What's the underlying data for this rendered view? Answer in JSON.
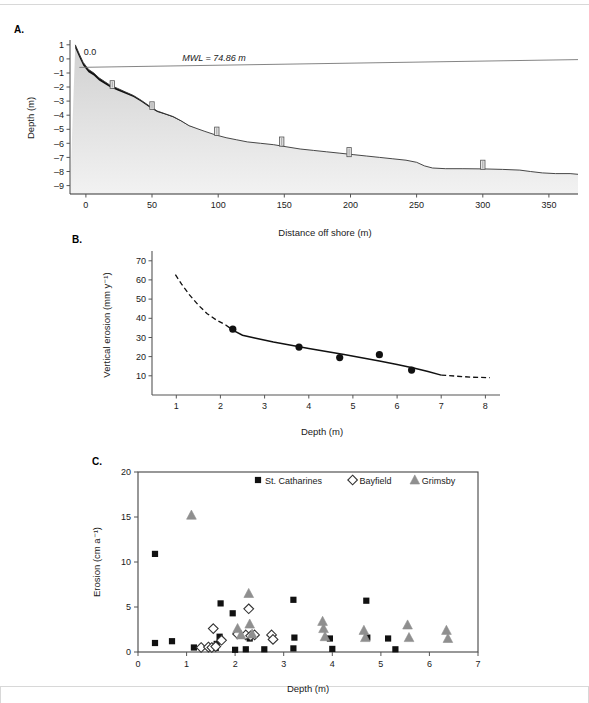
{
  "figure": {
    "panels": [
      "A.",
      "B.",
      "C."
    ]
  },
  "panel_a": {
    "letter": "A.",
    "xlabel": "Distance off shore (m)",
    "ylabel": "Depth (m)",
    "mwl_label": "MWL = 74.86 m",
    "origin_label": "0.0",
    "xticks": [
      0,
      50,
      100,
      150,
      200,
      250,
      300,
      350
    ],
    "yticks": [
      1,
      0,
      -1,
      -2,
      -3,
      -4,
      -5,
      -6,
      -7,
      -8,
      -9
    ],
    "xlim": [
      -12,
      372
    ],
    "ylim": [
      -9.6,
      1.2
    ],
    "mwl_level": -0.55,
    "profile": [
      [
        -8,
        1.0
      ],
      [
        -5,
        0.35
      ],
      [
        -2,
        -0.25
      ],
      [
        2,
        -0.75
      ],
      [
        6,
        -1.0
      ],
      [
        10,
        -1.35
      ],
      [
        14,
        -1.6
      ],
      [
        18,
        -1.85
      ],
      [
        24,
        -2.1
      ],
      [
        30,
        -2.35
      ],
      [
        36,
        -2.6
      ],
      [
        42,
        -2.95
      ],
      [
        48,
        -3.35
      ],
      [
        54,
        -3.7
      ],
      [
        60,
        -3.9
      ],
      [
        66,
        -4.1
      ],
      [
        72,
        -4.4
      ],
      [
        78,
        -4.75
      ],
      [
        84,
        -4.95
      ],
      [
        90,
        -5.15
      ],
      [
        98,
        -5.4
      ],
      [
        106,
        -5.6
      ],
      [
        114,
        -5.75
      ],
      [
        122,
        -5.9
      ],
      [
        132,
        -6.0
      ],
      [
        142,
        -6.1
      ],
      [
        152,
        -6.25
      ],
      [
        162,
        -6.4
      ],
      [
        172,
        -6.5
      ],
      [
        182,
        -6.6
      ],
      [
        192,
        -6.7
      ],
      [
        202,
        -6.8
      ],
      [
        212,
        -6.9
      ],
      [
        222,
        -7.0
      ],
      [
        232,
        -7.1
      ],
      [
        242,
        -7.2
      ],
      [
        250,
        -7.35
      ],
      [
        256,
        -7.6
      ],
      [
        262,
        -7.75
      ],
      [
        272,
        -7.8
      ],
      [
        285,
        -7.8
      ],
      [
        300,
        -7.82
      ],
      [
        315,
        -7.85
      ],
      [
        328,
        -7.9
      ],
      [
        336,
        -8.0
      ],
      [
        345,
        -8.1
      ],
      [
        355,
        -8.15
      ],
      [
        366,
        -8.15
      ],
      [
        372,
        -8.2
      ]
    ],
    "posts": [
      {
        "x": 20,
        "top": -1.55,
        "bottom": -2.1
      },
      {
        "x": 50,
        "top": -3.05,
        "bottom": -3.6
      },
      {
        "x": 99,
        "top": -4.85,
        "bottom": -5.45
      },
      {
        "x": 148,
        "top": -5.55,
        "bottom": -6.2
      },
      {
        "x": 199,
        "top": -6.3,
        "bottom": -6.95
      },
      {
        "x": 300,
        "top": -7.2,
        "bottom": -7.85
      }
    ],
    "colors": {
      "crust": "#111111",
      "fill_top": "#d0d0d0",
      "fill_bottom": "#f2f2f2",
      "post": "#e6e6e6",
      "post_edge": "#555555"
    }
  },
  "panel_b": {
    "letter": "B.",
    "xlabel": "Depth (m)",
    "ylabel": "Vertical erosion (mm y⁻¹)",
    "xticks": [
      1,
      2,
      3,
      4,
      5,
      6,
      7,
      8
    ],
    "yticks": [
      10,
      20,
      30,
      40,
      50,
      60,
      70
    ],
    "xlim": [
      0.45,
      8.15
    ],
    "ylim": [
      0,
      73
    ],
    "points": [
      {
        "x": 2.28,
        "y": 34.3
      },
      {
        "x": 3.78,
        "y": 25.0
      },
      {
        "x": 4.7,
        "y": 19.5
      },
      {
        "x": 5.6,
        "y": 21.0
      },
      {
        "x": 6.33,
        "y": 13.0
      }
    ],
    "curve_solid": [
      [
        2.12,
        36.5
      ],
      [
        2.3,
        33.6
      ],
      [
        2.5,
        31.2
      ],
      [
        2.8,
        29.6
      ],
      [
        3.2,
        27.6
      ],
      [
        3.6,
        25.9
      ],
      [
        4.0,
        24.3
      ],
      [
        4.4,
        22.7
      ],
      [
        4.8,
        21.1
      ],
      [
        5.2,
        19.4
      ],
      [
        5.6,
        17.7
      ],
      [
        6.0,
        15.9
      ],
      [
        6.4,
        14.0
      ],
      [
        6.7,
        12.2
      ],
      [
        7.0,
        10.4
      ]
    ],
    "curve_dashed_left": [
      [
        0.98,
        62.8
      ],
      [
        1.12,
        57.8
      ],
      [
        1.3,
        52.2
      ],
      [
        1.5,
        46.8
      ],
      [
        1.7,
        42.4
      ],
      [
        1.9,
        39.2
      ],
      [
        2.12,
        36.5
      ]
    ],
    "curve_dashed_right": [
      [
        7.0,
        10.4
      ],
      [
        7.35,
        9.8
      ],
      [
        7.7,
        9.3
      ],
      [
        8.1,
        9.0
      ]
    ],
    "marker_color": "#111111"
  },
  "panel_c": {
    "letter": "C.",
    "xlabel": "Depth (m)",
    "ylabel": "Erosion (cm a⁻¹)",
    "xticks": [
      0,
      1,
      2,
      3,
      4,
      5,
      6,
      7
    ],
    "yticks": [
      0,
      5,
      10,
      15,
      20
    ],
    "xlim": [
      0,
      7
    ],
    "ylim": [
      0,
      20
    ],
    "legend": [
      {
        "label": "St. Catharines",
        "marker": "square",
        "color": "#111111"
      },
      {
        "label": "Bayfield",
        "marker": "diamond",
        "color": "#333333"
      },
      {
        "label": "Grimsby",
        "marker": "triangle",
        "color": "#8f8f8f"
      }
    ],
    "series": [
      {
        "name": "St. Catharines",
        "marker": "square",
        "color": "#111111",
        "points": [
          [
            0.35,
            10.9
          ],
          [
            0.35,
            1.0
          ],
          [
            0.7,
            1.2
          ],
          [
            1.15,
            0.5
          ],
          [
            1.6,
            0.45
          ],
          [
            1.62,
            0.9
          ],
          [
            1.68,
            1.7
          ],
          [
            1.7,
            5.4
          ],
          [
            1.95,
            4.3
          ],
          [
            2.0,
            0.25
          ],
          [
            2.22,
            0.3
          ],
          [
            2.3,
            1.5
          ],
          [
            2.6,
            0.3
          ],
          [
            3.2,
            5.8
          ],
          [
            3.2,
            0.4
          ],
          [
            3.22,
            1.6
          ],
          [
            3.95,
            1.5
          ],
          [
            4.0,
            0.35
          ],
          [
            4.7,
            5.7
          ],
          [
            4.72,
            1.6
          ],
          [
            5.15,
            1.5
          ],
          [
            5.3,
            0.3
          ]
        ]
      },
      {
        "name": "Bayfield",
        "marker": "diamond",
        "color": "#333333",
        "points": [
          [
            1.3,
            0.5
          ],
          [
            1.45,
            0.55
          ],
          [
            1.52,
            0.5
          ],
          [
            1.6,
            0.6
          ],
          [
            1.55,
            2.6
          ],
          [
            1.72,
            1.3
          ],
          [
            2.05,
            2.0
          ],
          [
            2.22,
            1.9
          ],
          [
            2.28,
            4.8
          ],
          [
            2.32,
            1.8
          ],
          [
            2.4,
            1.9
          ],
          [
            2.75,
            1.9
          ],
          [
            2.78,
            1.4
          ]
        ]
      },
      {
        "name": "Grimsby",
        "marker": "triangle",
        "color": "#8f8f8f",
        "points": [
          [
            1.1,
            15.2
          ],
          [
            2.05,
            2.6
          ],
          [
            2.12,
            1.9
          ],
          [
            2.28,
            6.5
          ],
          [
            2.3,
            3.1
          ],
          [
            2.35,
            2.0
          ],
          [
            3.8,
            3.4
          ],
          [
            3.82,
            2.6
          ],
          [
            3.85,
            1.7
          ],
          [
            4.65,
            2.4
          ],
          [
            4.68,
            1.6
          ],
          [
            5.55,
            3.0
          ],
          [
            5.58,
            1.6
          ],
          [
            6.35,
            2.4
          ],
          [
            6.38,
            1.5
          ]
        ]
      }
    ]
  }
}
